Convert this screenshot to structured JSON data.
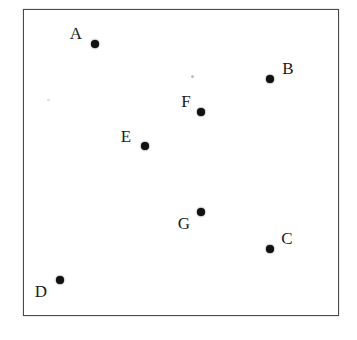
{
  "figure": {
    "title": "",
    "background_color": "#ffffff",
    "frame": {
      "x": 23,
      "y": 9,
      "width": 316,
      "height": 307,
      "border_color": "#4a4a4a",
      "border_width": 1.5
    },
    "dot_color": "#111111",
    "label_color": "#1a1a1a"
  },
  "chart_data": {
    "type": "scatter",
    "title": "",
    "xlabel": "",
    "ylabel": "",
    "grid": false,
    "legend": "none",
    "axis_visible": false,
    "xlim": [
      23,
      339
    ],
    "ylim": [
      9,
      316
    ],
    "point_labels": [
      "A",
      "B",
      "C",
      "D",
      "E",
      "F",
      "G"
    ],
    "points": [
      {
        "label": "A",
        "x": 95,
        "y": 44,
        "label_x": 76,
        "label_y": 33,
        "label_position": "upper-left"
      },
      {
        "label": "B",
        "x": 270,
        "y": 79,
        "label_x": 288,
        "label_y": 68,
        "label_position": "upper-right"
      },
      {
        "label": "C",
        "x": 270,
        "y": 249,
        "label_x": 287,
        "label_y": 238,
        "label_position": "upper-right"
      },
      {
        "label": "D",
        "x": 60,
        "y": 280,
        "label_x": 41,
        "label_y": 291,
        "label_position": "lower-left"
      },
      {
        "label": "E",
        "x": 145,
        "y": 146,
        "label_x": 126,
        "label_y": 136,
        "label_position": "upper-left"
      },
      {
        "label": "F",
        "x": 201,
        "y": 112,
        "label_x": 186,
        "label_y": 101,
        "label_position": "upper-left"
      },
      {
        "label": "G",
        "x": 201,
        "y": 212,
        "label_x": 184,
        "label_y": 223,
        "label_position": "lower-left"
      }
    ]
  },
  "artifacts": {
    "specks": [
      {
        "x": 192,
        "y": 76,
        "size": "s1"
      },
      {
        "x": 48,
        "y": 100,
        "size": "s2"
      }
    ]
  }
}
